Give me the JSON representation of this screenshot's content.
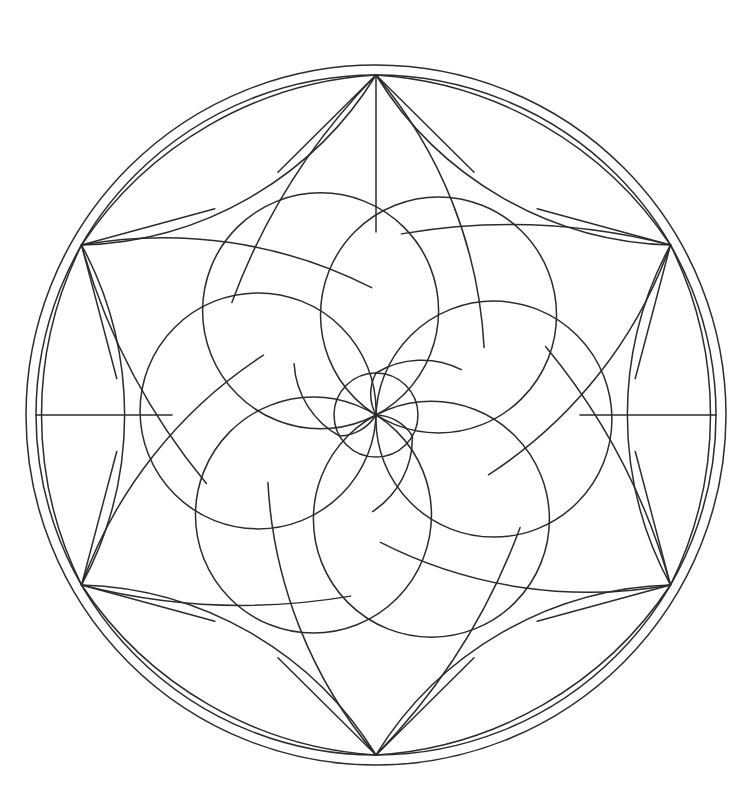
{
  "document": {
    "kind": "line-art-illustration",
    "subject": "mandala-stained-glass-rosette",
    "background_color": "#ffffff",
    "stroke_color": "#2b2b2b",
    "stroke_width": 1.5,
    "canvas": {
      "width": 743,
      "height": 808
    }
  },
  "geometry": {
    "center": {
      "x": 376,
      "y": 415
    },
    "outer_ring_radius": 350,
    "inner_ring_radius": 340,
    "petal_tip_radius": 340,
    "node_ring_radius": 340,
    "spiral_circle_count": 6,
    "spiral_circle_radius": 118,
    "spiral_orbit_radius": 118,
    "core_circle_radius": 42,
    "core_arc_count": 3,
    "outer_petal_count": 6,
    "triangle_wedge_count": 6,
    "symmetry_order": 6,
    "spiral_handedness": "counter-clockwise"
  },
  "nodes": {
    "label": "six convergence points on the inner ring",
    "angles_deg": [
      270,
      330,
      30,
      90,
      150,
      210
    ],
    "points": [
      {
        "name": "node-top",
        "x": 376,
        "y": 75
      },
      {
        "name": "node-upper-right",
        "x": 670,
        "y": 245
      },
      {
        "name": "node-lower-right",
        "x": 670,
        "y": 585
      },
      {
        "name": "node-bottom",
        "x": 376,
        "y": 755
      },
      {
        "name": "node-lower-left",
        "x": 82,
        "y": 585
      },
      {
        "name": "node-upper-left",
        "x": 82,
        "y": 245
      }
    ]
  },
  "radial_lines": {
    "label": "straight spokes from node to petal seam",
    "count": 6,
    "items": [
      {
        "name": "spoke-top",
        "angle_deg": 270
      },
      {
        "name": "spoke-left",
        "angle_deg": 180
      },
      {
        "name": "spoke-right",
        "angle_deg": 0
      }
    ]
  },
  "layers": [
    {
      "name": "outer-ring-outer",
      "type": "circle",
      "radius": 350
    },
    {
      "name": "outer-ring-inner",
      "type": "circle",
      "radius": 340
    },
    {
      "name": "petal-band",
      "type": "petals",
      "count": 6
    },
    {
      "name": "wedge-band",
      "type": "triangles",
      "count": 6
    },
    {
      "name": "spiral-band",
      "type": "circles",
      "count": 6
    },
    {
      "name": "core",
      "type": "pinwheel",
      "arcs": 3
    }
  ],
  "palette": {
    "line": "#2b2b2b",
    "fill": "#ffffff",
    "paper": "#ffffff"
  }
}
